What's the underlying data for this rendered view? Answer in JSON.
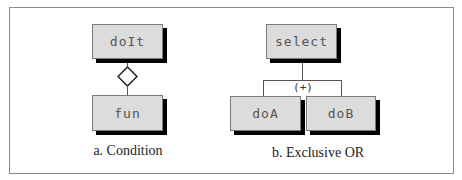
{
  "figure": {
    "panels": [
      {
        "id": "condition",
        "caption": "a. Condition",
        "nodes": [
          {
            "label": "doIt"
          },
          {
            "label": "fun"
          }
        ],
        "connector": "diamond"
      },
      {
        "id": "exclusive-or",
        "caption": "b. Exclusive OR",
        "nodes": [
          {
            "label": "select"
          },
          {
            "label": "doA"
          },
          {
            "label": "doB"
          }
        ],
        "connector_label": "(+)"
      }
    ]
  }
}
